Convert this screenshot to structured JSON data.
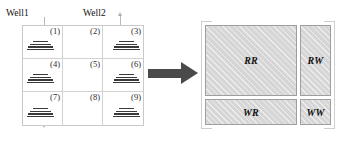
{
  "figure": {
    "left_panel": {
      "well_labels": [
        {
          "name": "well1",
          "text": "Well1"
        },
        {
          "name": "well2",
          "text": "Well2"
        }
      ],
      "well_arrows": [
        {
          "name": "well1-flow-arrow",
          "direction": "down"
        },
        {
          "name": "well2-flow-arrow",
          "direction": "up"
        }
      ],
      "grid": {
        "rows": 3,
        "cols": 3,
        "cells": [
          {
            "number": "(1)",
            "fracture": true
          },
          {
            "number": "(2)",
            "fracture": false
          },
          {
            "number": "(3)",
            "fracture": true
          },
          {
            "number": "(4)",
            "fracture": true
          },
          {
            "number": "(5)",
            "fracture": false
          },
          {
            "number": "(6)",
            "fracture": true
          },
          {
            "number": "(7)",
            "fracture": true
          },
          {
            "number": "(8)",
            "fracture": false
          },
          {
            "number": "(9)",
            "fracture": true
          }
        ]
      }
    },
    "transform_arrow": {
      "name": "transform-arrow",
      "direction": "right"
    },
    "right_panel": {
      "quadrants": [
        {
          "key": "rr",
          "label": "RR"
        },
        {
          "key": "rw",
          "label": "RW"
        },
        {
          "key": "wr",
          "label": "WR"
        },
        {
          "key": "ww",
          "label": "WW"
        }
      ]
    },
    "colors": {
      "grid_line": "#c9c9c9",
      "well_line": "#b9b9b9",
      "arrow": "#4a4a4a",
      "quad_fill": "#d6d6d6",
      "quad_border": "#9e9e9e",
      "text": "#111111"
    }
  }
}
